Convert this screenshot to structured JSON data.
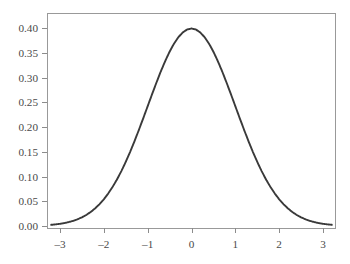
{
  "chart_data": {
    "type": "line",
    "title": "",
    "subtitle": "",
    "xlabel": "",
    "ylabel": "",
    "xlim": [
      -3.2,
      3.2
    ],
    "ylim": [
      0.0,
      0.4235
    ],
    "xticks": [
      -3,
      -2,
      -1,
      0,
      1,
      2,
      3
    ],
    "xticklabels": [
      "–3",
      "–2",
      "–1",
      "0",
      "1",
      "2",
      "3"
    ],
    "yticks": [
      0.0,
      0.05,
      0.1,
      0.15,
      0.2,
      0.25,
      0.3,
      0.35,
      0.4
    ],
    "yticklabels": [
      "0.00",
      "0.05",
      "0.10",
      "0.15",
      "0.20",
      "0.25",
      "0.30",
      "0.35",
      "0.40"
    ],
    "grid": false,
    "legend": null,
    "legend_position": "none",
    "frame": "box",
    "series": [
      {
        "name": "standard normal pdf",
        "color": "#3a3a3a",
        "linewidth": 1.9,
        "x": [
          -3.2,
          -3.1,
          -3.0,
          -2.9,
          -2.8,
          -2.7,
          -2.6,
          -2.5,
          -2.4,
          -2.3,
          -2.2,
          -2.1,
          -2.0,
          -1.9,
          -1.8,
          -1.7,
          -1.6,
          -1.5,
          -1.4,
          -1.3,
          -1.2,
          -1.1,
          -1.0,
          -0.9,
          -0.8,
          -0.7,
          -0.6,
          -0.5,
          -0.4,
          -0.3,
          -0.2,
          -0.1,
          0.0,
          0.1,
          0.2,
          0.3,
          0.4,
          0.5,
          0.6,
          0.7,
          0.8,
          0.9,
          1.0,
          1.1,
          1.2,
          1.3,
          1.4,
          1.5,
          1.6,
          1.7,
          1.8,
          1.9,
          2.0,
          2.1,
          2.2,
          2.3,
          2.4,
          2.5,
          2.6,
          2.7,
          2.8,
          2.9,
          3.0,
          3.1,
          3.2
        ],
        "y": [
          0.0024,
          0.0033,
          0.0044,
          0.006,
          0.0079,
          0.0104,
          0.0136,
          0.0175,
          0.0224,
          0.0283,
          0.0355,
          0.044,
          0.054,
          0.0656,
          0.079,
          0.094,
          0.1109,
          0.1295,
          0.1497,
          0.1714,
          0.1942,
          0.2179,
          0.242,
          0.2661,
          0.2897,
          0.3123,
          0.3332,
          0.3521,
          0.3683,
          0.3814,
          0.391,
          0.397,
          0.3989,
          0.397,
          0.391,
          0.3814,
          0.3683,
          0.3521,
          0.3332,
          0.3123,
          0.2897,
          0.2661,
          0.242,
          0.2179,
          0.1942,
          0.1714,
          0.1497,
          0.1295,
          0.1109,
          0.094,
          0.079,
          0.0656,
          0.054,
          0.044,
          0.0355,
          0.0283,
          0.0224,
          0.0175,
          0.0136,
          0.0104,
          0.0079,
          0.006,
          0.0044,
          0.0033,
          0.0024
        ]
      }
    ]
  },
  "style": {
    "background": "#ffffff",
    "axis_color": "#999999",
    "tick_color": "#8c8c8c",
    "label_color": "#4a4a4a",
    "curve_color": "#3a3a3a"
  },
  "geometry": {
    "plot_left": 47,
    "plot_right": 335,
    "plot_top": 13,
    "plot_bottom": 228,
    "x_at_minus3": 60,
    "x_at_plus3": 323,
    "y_at_0": 226,
    "y_at_040": 28
  }
}
